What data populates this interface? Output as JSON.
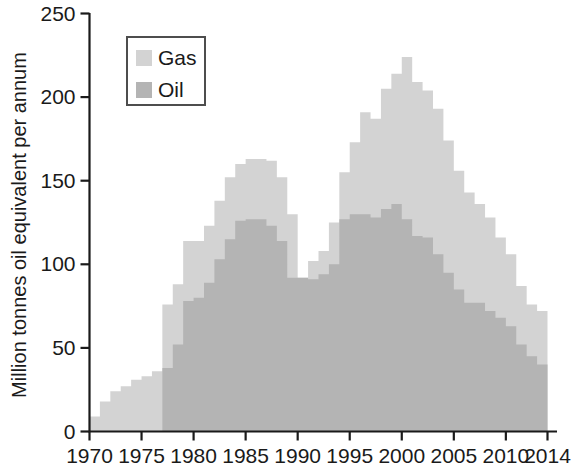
{
  "chart_data": {
    "type": "area",
    "title": "",
    "subtitle": "",
    "xlabel": "",
    "ylabel": "Million tonnes oil equivalent per annum",
    "xlim": [
      1970,
      2014
    ],
    "ylim": [
      0,
      250
    ],
    "grid": false,
    "legend_position": "top-left",
    "stacked": true,
    "x": [
      1970,
      1971,
      1972,
      1973,
      1974,
      1975,
      1976,
      1977,
      1978,
      1979,
      1980,
      1981,
      1982,
      1983,
      1984,
      1985,
      1986,
      1987,
      1988,
      1989,
      1990,
      1991,
      1992,
      1993,
      1994,
      1995,
      1996,
      1997,
      1998,
      1999,
      2000,
      2001,
      2002,
      2003,
      2004,
      2005,
      2006,
      2007,
      2008,
      2009,
      2010,
      2011,
      2012,
      2013
    ],
    "x_tick_labels": [
      "1970",
      "1975",
      "1980",
      "1985",
      "1990",
      "1995",
      "2000",
      "2005",
      "2010",
      "2014"
    ],
    "x_tick_values": [
      1970,
      1975,
      1980,
      1985,
      1990,
      1995,
      2000,
      2005,
      2010,
      2014
    ],
    "y_tick_labels": [
      "0",
      "50",
      "100",
      "150",
      "200",
      "250"
    ],
    "y_tick_values": [
      0,
      50,
      100,
      150,
      200,
      250
    ],
    "series": [
      {
        "name": "Oil",
        "color": "#b4b4b4",
        "values": [
          0,
          0,
          0,
          0,
          0,
          0,
          0,
          38,
          52,
          78,
          80,
          89,
          103,
          115,
          126,
          127,
          127,
          123,
          114,
          92,
          92,
          91,
          94,
          100,
          127,
          130,
          130,
          128,
          133,
          136,
          127,
          117,
          116,
          106,
          95,
          85,
          77,
          77,
          72,
          68,
          63,
          52,
          45,
          40
        ]
      },
      {
        "name": "Gas",
        "color": "#d3d3d3",
        "values": [
          9,
          18,
          24,
          27,
          31,
          33,
          36,
          38,
          36,
          36,
          34,
          34,
          35,
          37,
          34,
          36,
          36,
          39,
          38,
          38,
          0,
          11,
          14,
          25,
          28,
          43,
          61,
          59,
          72,
          78,
          97,
          92,
          88,
          87,
          79,
          71,
          66,
          59,
          56,
          48,
          43,
          35,
          31,
          32
        ]
      }
    ],
    "totals": [
      9,
      18,
      24,
      27,
      31,
      33,
      36,
      76,
      88,
      114,
      114,
      123,
      138,
      152,
      160,
      163,
      163,
      162,
      152,
      130,
      92,
      102,
      108,
      125,
      155,
      173,
      191,
      187,
      205,
      214,
      224,
      209,
      204,
      193,
      174,
      156,
      143,
      136,
      128,
      116,
      106,
      87,
      76,
      72
    ]
  },
  "legend": {
    "items": [
      {
        "label": "Gas",
        "color": "#d3d3d3"
      },
      {
        "label": "Oil",
        "color": "#b4b4b4"
      }
    ]
  },
  "axes": {
    "y_title": "Million tonnes oil equivalent per annum"
  }
}
